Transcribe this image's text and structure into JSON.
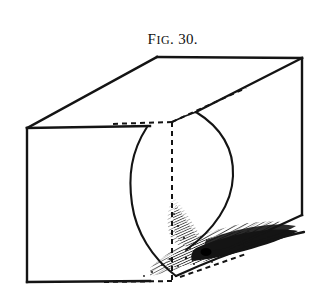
{
  "plate": {
    "background_color": "#ffffff",
    "ink_color": "#141414",
    "width": 328,
    "height": 304
  },
  "caption": {
    "lead_letter": "F",
    "small_caps": "IG",
    "separator": ". ",
    "number": "30."
  },
  "figure": {
    "style": "line engraving with stipple and hatch shading",
    "box": {
      "front_top_left": [
        27,
        128
      ],
      "front_bottom_left": [
        27,
        282
      ],
      "back_top_left": [
        157,
        57
      ],
      "back_top_right": [
        302,
        58
      ],
      "right_bottom": [
        302,
        215
      ],
      "front_bottom_right": [
        196,
        281
      ],
      "hidden_corner_top": [
        172,
        122
      ],
      "hidden_corner_bottom": [
        172,
        281
      ]
    },
    "surface": {
      "left_arc_apex": [
        128,
        192
      ],
      "right_arc_apex": [
        233,
        176
      ],
      "waist_x": 172,
      "waist_y": 230
    },
    "hidden_edges": {
      "style": "dashed",
      "dash_pattern": "5 4",
      "edges": [
        "front-top edge from waist leftward along top face",
        "vertical back corner from top face down to base",
        "base edge from bottom-left toward front-bottom-right"
      ]
    },
    "shading": {
      "region": "valley of the saddle near the base",
      "density": "dense irregular hatching grading to solid black wedge"
    }
  }
}
